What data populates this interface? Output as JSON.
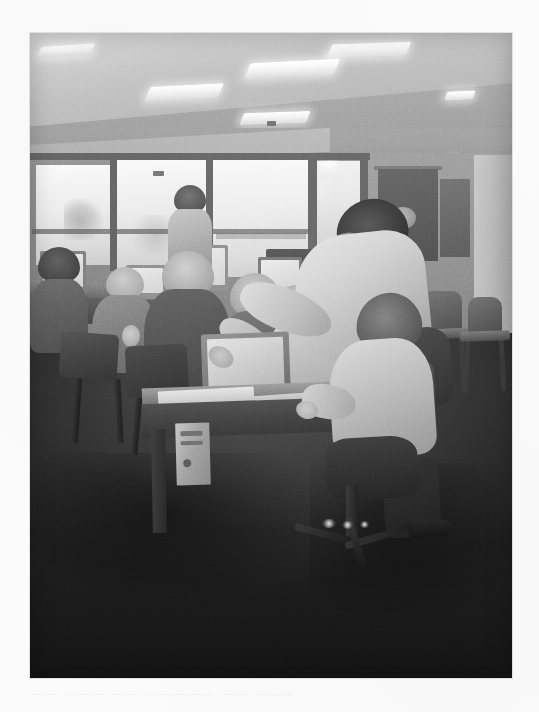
{
  "page": {
    "background_color": "#fbfbfc",
    "width": 539,
    "height": 712,
    "ghost_text": "—— ——— —— ————— —— ———"
  },
  "photo": {
    "alt": "Scanned black-and-white photograph of a computer training classroom",
    "description": "A standing instructor in a light shirt and dark trousers leans over a seated student at a CRT computer, pointing at the screen. Several older adults sit at a row of computers along a bank of windows in the background. Empty stacking chairs line the right wall beneath fluorescent ceiling lights.",
    "frame": {
      "x": 30,
      "y": 33,
      "width": 482,
      "height": 645
    },
    "tone": "grayscale",
    "colors": {
      "ceiling": "#b9b9b9",
      "wall": "#8d8d8d",
      "window_glass": "#f3f3f3",
      "floor": "#2c2c2c",
      "highlight": "#ffffff",
      "shadow": "#1f1f1f",
      "paper_margin": "#fbfbfc"
    },
    "regions": [
      {
        "name": "ceiling-with-fluorescent-lights",
        "count_lights": 6
      },
      {
        "name": "window-wall-left",
        "panes": 4
      },
      {
        "name": "back-wall-with-doorway"
      },
      {
        "name": "computer-workstation-row"
      },
      {
        "name": "foreground-desk-with-crt-monitor"
      },
      {
        "name": "standing-instructor"
      },
      {
        "name": "seated-student"
      },
      {
        "name": "stacking-chairs-right-wall",
        "count": 2
      },
      {
        "name": "dark-carpeted-floor"
      }
    ],
    "people": [
      {
        "id": "instructor",
        "role": "standing instructor pointing at screen",
        "attire": "light long-sleeve shirt, dark trousers"
      },
      {
        "id": "student-foreground",
        "role": "seated student at computer",
        "attire": "light shirt, light hair"
      },
      {
        "id": "participant-1",
        "role": "seated at computer, back to camera"
      },
      {
        "id": "participant-2",
        "role": "seated at computer, hand raised to face"
      },
      {
        "id": "participant-3",
        "role": "seated at computer, light hair"
      },
      {
        "id": "participant-4",
        "role": "seated at computer, light hair"
      },
      {
        "id": "participant-5",
        "role": "seated at computer, light shirt"
      },
      {
        "id": "participant-6",
        "role": "standing near the window"
      }
    ],
    "equipment": [
      {
        "name": "crt-monitor",
        "count": 5
      },
      {
        "name": "computer-tower",
        "count": 1
      },
      {
        "name": "keyboard",
        "count": 1
      },
      {
        "name": "mouse",
        "count": 1
      },
      {
        "name": "papers-on-desk",
        "count": 1
      },
      {
        "name": "rolling-office-chair",
        "count": 1
      }
    ]
  }
}
